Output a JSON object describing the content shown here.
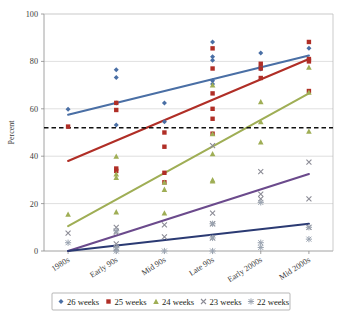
{
  "chart_data": {
    "type": "scatter",
    "title": "",
    "subtitle": "",
    "xlabel": "",
    "ylabel": "Percent",
    "ylim": [
      0,
      100
    ],
    "yticks": [
      0,
      20,
      40,
      60,
      80,
      100
    ],
    "grid": true,
    "legend_position": "bottom",
    "categories": [
      "1980s",
      "Early 90s",
      "Mid 90s",
      "Late 90s",
      "Early 2000s",
      "Mid 2000s"
    ],
    "annotations": [
      {
        "name": "threshold-line",
        "type": "horizontal-dashed-line",
        "value": 52,
        "label": ""
      }
    ],
    "series": [
      {
        "name": "26 weeks",
        "color": "#4a6fa5",
        "marker": "diamond",
        "points": [
          {
            "category": "1980s",
            "x": 0,
            "values": [
              59.8
            ]
          },
          {
            "category": "Early 90s",
            "x": 1,
            "values": [
              76.5,
              73.2,
              62.5,
              53.2
            ]
          },
          {
            "category": "Mid 90s",
            "x": 2,
            "values": [
              62.5,
              54.5
            ]
          },
          {
            "category": "Late 90s",
            "x": 3,
            "values": [
              88.2,
              82.0,
              80.5,
              71.8,
              70.5
            ]
          },
          {
            "category": "Early 2000s",
            "x": 4,
            "values": [
              83.5,
              78.0,
              76.8
            ]
          },
          {
            "category": "Mid 2000s",
            "x": 5,
            "values": [
              85.5,
              81.0
            ]
          }
        ],
        "trendline": {
          "start_value": 57.5,
          "end_value": 82.5
        }
      },
      {
        "name": "25 weeks",
        "color": "#b02e26",
        "marker": "square",
        "points": [
          {
            "category": "1980s",
            "x": 0,
            "values": [
              52.5
            ]
          },
          {
            "category": "Early 90s",
            "x": 1,
            "values": [
              62.5,
              59.5,
              34.8,
              33.8
            ]
          },
          {
            "category": "Mid 90s",
            "x": 2,
            "values": [
              50.0,
              44.0,
              33.0,
              29.0
            ]
          },
          {
            "category": "Late 90s",
            "x": 3,
            "values": [
              85.5,
              77.0,
              66.5,
              60.0,
              55.8,
              49.5
            ]
          },
          {
            "category": "Early 2000s",
            "x": 4,
            "values": [
              79.0,
              77.0,
              73.0
            ]
          },
          {
            "category": "Mid 2000s",
            "x": 5,
            "values": [
              88.2,
              81.0,
              80.0,
              67.5
            ]
          }
        ],
        "trendline": {
          "start_value": 38.0,
          "end_value": 81.0
        }
      },
      {
        "name": "24 weeks",
        "color": "#9fae55",
        "marker": "triangle",
        "points": [
          {
            "category": "1980s",
            "x": 0,
            "values": [
              15.5
            ]
          },
          {
            "category": "Early 90s",
            "x": 1,
            "values": [
              40.0,
              32.5,
              31.0,
              16.5
            ]
          },
          {
            "category": "Mid 90s",
            "x": 2,
            "values": [
              29.0,
              26.0,
              16.0
            ]
          },
          {
            "category": "Late 90s",
            "x": 3,
            "values": [
              70.0,
              49.5,
              41.0,
              30.0,
              29.5
            ]
          },
          {
            "category": "Early 2000s",
            "x": 4,
            "values": [
              63.0,
              54.5,
              46.0
            ]
          },
          {
            "category": "Mid 2000s",
            "x": 5,
            "values": [
              77.5,
              67.0,
              50.5
            ]
          }
        ],
        "trendline": {
          "start_value": 10.5,
          "end_value": 66.5
        }
      },
      {
        "name": "23 weeks",
        "color": "#6b4a8c",
        "marker": "x",
        "points": [
          {
            "category": "1980s",
            "x": 0,
            "values": [
              7.5
            ]
          },
          {
            "category": "Early 90s",
            "x": 1,
            "values": [
              10.0,
              8.0,
              3.0,
              1.0
            ]
          },
          {
            "category": "Mid 90s",
            "x": 2,
            "values": [
              11.0,
              6.0
            ]
          },
          {
            "category": "Late 90s",
            "x": 3,
            "values": [
              44.5,
              16.0,
              11.5,
              5.5
            ]
          },
          {
            "category": "Early 2000s",
            "x": 4,
            "values": [
              33.5,
              24.0,
              22.0
            ]
          },
          {
            "category": "Mid 2000s",
            "x": 5,
            "values": [
              37.5,
              22.0,
              10.0
            ]
          }
        ],
        "trendline": {
          "start_value": -1.5,
          "end_value": 32.5
        }
      },
      {
        "name": "22 weeks",
        "color": "#2b3a73",
        "marker": "asterisk",
        "points": [
          {
            "category": "1980s",
            "x": 0,
            "values": [
              3.5
            ]
          },
          {
            "category": "Early 90s",
            "x": 1,
            "values": [
              8.5,
              1.5,
              0.0
            ]
          },
          {
            "category": "Mid 90s",
            "x": 2,
            "values": [
              0.0
            ]
          },
          {
            "category": "Late 90s",
            "x": 3,
            "values": [
              11.5,
              5.5,
              0.0
            ]
          },
          {
            "category": "Early 2000s",
            "x": 4,
            "values": [
              20.5,
              3.5,
              1.5
            ]
          },
          {
            "category": "Mid 2000s",
            "x": 5,
            "values": [
              10.0,
              5.0
            ]
          }
        ],
        "trendline": {
          "start_value": -1.0,
          "end_value": 11.5
        }
      }
    ]
  },
  "axis": {
    "y_title": "Percent",
    "y_tick_labels": [
      "100",
      "80",
      "60",
      "40",
      "20",
      "0"
    ],
    "x_tick_labels": [
      "1980s",
      "Early 90s",
      "Mid 90s",
      "Late 90s",
      "Early 2000s",
      "Mid 2000s"
    ]
  },
  "legend": {
    "items": [
      {
        "label": "26 weeks",
        "color": "#4a6fa5",
        "marker": "diamond"
      },
      {
        "label": "25 weeks",
        "color": "#b02e26",
        "marker": "square"
      },
      {
        "label": "24 weeks",
        "color": "#9fae55",
        "marker": "triangle"
      },
      {
        "label": "23 weeks",
        "color": "#8a8a8a",
        "marker": "x"
      },
      {
        "label": "22 weeks",
        "color": "#9aa3b0",
        "marker": "asterisk"
      }
    ]
  },
  "colors": {
    "series_26": "#4a6fa5",
    "series_25": "#b02e26",
    "series_24": "#9fae55",
    "series_23": "#6b4a8c",
    "series_22": "#2b3a73",
    "threshold": "#111111",
    "grid": "#c9c9c9",
    "background": "#ffffff"
  }
}
